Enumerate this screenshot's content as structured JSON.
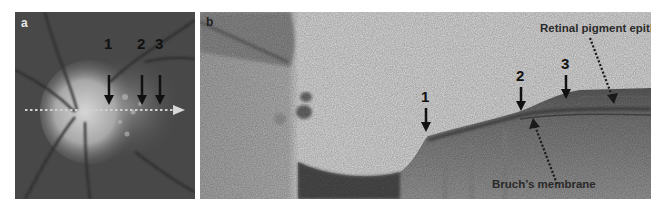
{
  "figure": {
    "panels": [
      {
        "id": "a",
        "label": "a",
        "description": "Fundus photograph of optic disc with dotted scan line",
        "markers": [
          "1",
          "2",
          "3"
        ]
      },
      {
        "id": "b",
        "label": "b",
        "description": "OCT cross-section along scan line",
        "markers": [
          "1",
          "2",
          "3"
        ],
        "annotations": {
          "rpe": "Retinal pigment epithelium",
          "bruch": "Bruch’s membrane"
        }
      }
    ],
    "colors": {
      "fundus_bg": "#4a4a4a",
      "oct_bg": "#d8d8d8",
      "arrow": "#111111",
      "scan_line": "#c8c8c8"
    }
  }
}
